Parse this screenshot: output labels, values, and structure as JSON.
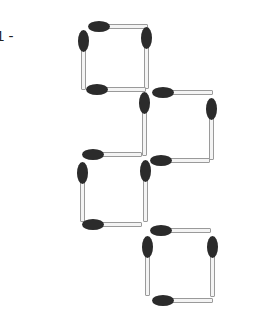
{
  "puzzle_label": "1 -",
  "colors": {
    "head": "#2b2b2b",
    "stick": "#f4f4f4",
    "stick_border": "#9a9a9a"
  },
  "matches": [
    {
      "orientation": "h",
      "x": 88,
      "y": 23,
      "len": 60,
      "head": "left"
    },
    {
      "orientation": "v",
      "x": 80,
      "y": 30,
      "len": 60,
      "head": "top"
    },
    {
      "orientation": "v",
      "x": 143,
      "y": 27,
      "len": 62,
      "head": "top"
    },
    {
      "orientation": "h",
      "x": 86,
      "y": 86,
      "len": 60,
      "head": "left"
    },
    {
      "orientation": "h",
      "x": 152,
      "y": 89,
      "len": 61,
      "head": "left"
    },
    {
      "orientation": "v",
      "x": 141,
      "y": 92,
      "len": 64,
      "head": "top"
    },
    {
      "orientation": "v",
      "x": 208,
      "y": 98,
      "len": 62,
      "head": "top"
    },
    {
      "orientation": "h",
      "x": 150,
      "y": 157,
      "len": 60,
      "head": "left"
    },
    {
      "orientation": "h",
      "x": 82,
      "y": 151,
      "len": 60,
      "head": "left"
    },
    {
      "orientation": "v",
      "x": 79,
      "y": 162,
      "len": 60,
      "head": "top"
    },
    {
      "orientation": "v",
      "x": 142,
      "y": 160,
      "len": 62,
      "head": "top"
    },
    {
      "orientation": "h",
      "x": 82,
      "y": 221,
      "len": 60,
      "head": "left"
    },
    {
      "orientation": "h",
      "x": 150,
      "y": 227,
      "len": 61,
      "head": "left"
    },
    {
      "orientation": "v",
      "x": 144,
      "y": 236,
      "len": 60,
      "head": "top"
    },
    {
      "orientation": "v",
      "x": 209,
      "y": 236,
      "len": 61,
      "head": "top"
    },
    {
      "orientation": "h",
      "x": 152,
      "y": 297,
      "len": 61,
      "head": "left"
    }
  ]
}
